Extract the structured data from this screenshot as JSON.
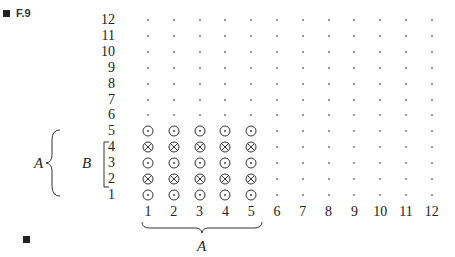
{
  "figure": {
    "label": "F.9"
  },
  "rows": [
    "1",
    "2",
    "3",
    "4",
    "5",
    "6",
    "7",
    "8",
    "9",
    "10",
    "11",
    "12"
  ],
  "cols": [
    "1",
    "2",
    "3",
    "4",
    "5",
    "6",
    "7",
    "8",
    "9",
    "10",
    "11",
    "12"
  ],
  "symbols": {
    "row_5": "odot",
    "row_4": "otimes",
    "row_3": "odot",
    "row_2": "otimes",
    "row_1": "odot"
  },
  "brackets": {
    "outer_left_label": "A",
    "inner_left_label": "B",
    "bottom_label": "A"
  }
}
